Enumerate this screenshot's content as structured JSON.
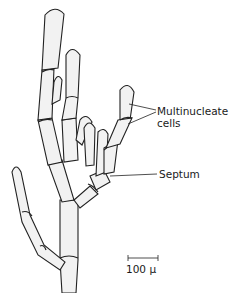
{
  "figure": {
    "labels": {
      "multinucleate": "Multinucleate",
      "cells": "cells",
      "septum": "Septum"
    },
    "scale_bar": {
      "label": "100 μ",
      "length_px": 30
    },
    "colors": {
      "ink": "#222222",
      "background": "#ffffff",
      "cell_fill": "#f2f2f2"
    }
  }
}
